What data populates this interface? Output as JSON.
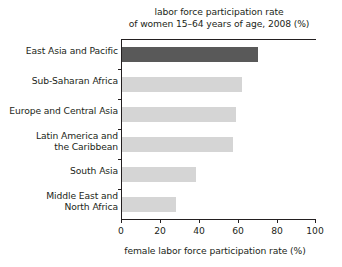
{
  "chart_data": {
    "type": "bar",
    "orientation": "horizontal",
    "title": "labor force participation rate of women 15–64 years of age, 2008 (%)",
    "title_lines": [
      "labor force participation rate",
      "of women 15–64 years of age, 2008 (%)"
    ],
    "xlabel": "female labor force participation rate (%)",
    "ylabel": "",
    "xlim": [
      0,
      100
    ],
    "xticks": [
      0,
      20,
      40,
      60,
      80,
      100
    ],
    "xticklabels": [
      "0",
      "20",
      "40",
      "60",
      "80",
      "100"
    ],
    "grid": false,
    "legend": false,
    "categories": [
      "East Asia and Pacific",
      "Sub-Saharan Africa",
      "Europe and Central Asia",
      "Latin America and the Caribbean",
      "South Asia",
      "Middle East and North Africa"
    ],
    "category_label_lines": [
      [
        "East Asia and Pacific"
      ],
      [
        "Sub-Saharan Africa"
      ],
      [
        "Europe and Central Asia"
      ],
      [
        "Latin America and",
        "the Caribbean"
      ],
      [
        "South Asia"
      ],
      [
        "Middle East and",
        "North Africa"
      ]
    ],
    "values": [
      70,
      62,
      59,
      57,
      38,
      28
    ],
    "bar_colors": [
      "#595959",
      "#d5d5d5",
      "#d5d5d5",
      "#d5d5d5",
      "#d5d5d5",
      "#d5d5d5"
    ],
    "highlight_index": 0,
    "colors": {
      "highlight": "#595959",
      "default": "#d5d5d5",
      "axis": "#231f20",
      "text": "#231f20",
      "background": "#ffffff"
    }
  }
}
